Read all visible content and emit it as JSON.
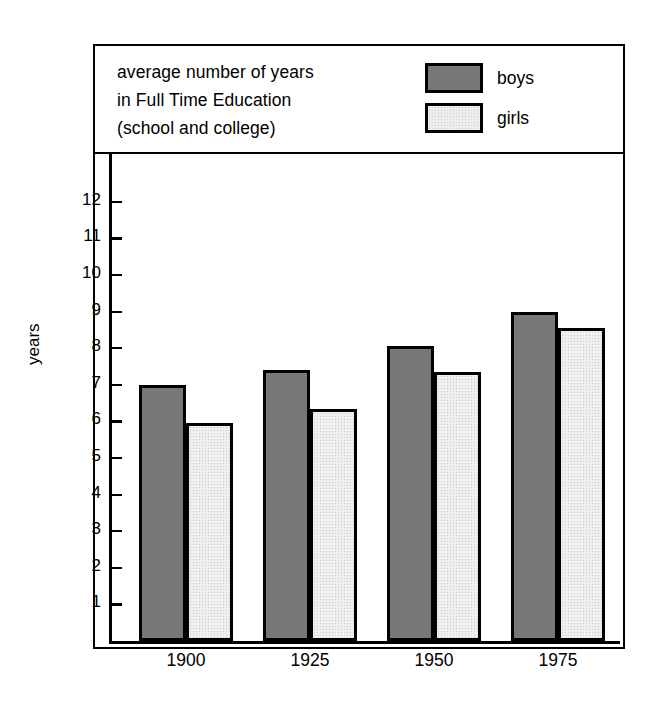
{
  "chart_data": {
    "type": "bar",
    "title": "average number of years in Full Time Education (school and college)",
    "title_lines": [
      "average number of years",
      "in Full Time Education",
      "(school and college)"
    ],
    "xlabel": "",
    "ylabel": "years",
    "categories": [
      "1900",
      "1925",
      "1950",
      "1975"
    ],
    "series": [
      {
        "name": "boys",
        "values": [
          7.0,
          7.4,
          8.05,
          9.0
        ],
        "color": "#777777"
      },
      {
        "name": "girls",
        "values": [
          5.95,
          6.35,
          7.35,
          8.55
        ],
        "color": "#efefef"
      }
    ],
    "ylim": [
      0,
      12.7
    ],
    "yticks": [
      12,
      11,
      10,
      9,
      8,
      7,
      6,
      5,
      4,
      3,
      2,
      1
    ],
    "ytick_labels": [
      "12",
      "11",
      "10",
      "9",
      "8",
      "7",
      "6",
      "5",
      "4",
      "3",
      "2",
      "1"
    ],
    "grid": false,
    "legend_position": "top-right",
    "legend": [
      {
        "label": "boys",
        "swatch": "solid-dark-gray"
      },
      {
        "label": "girls",
        "swatch": "light-dotted"
      }
    ]
  },
  "axis": {
    "y_title": "years"
  }
}
